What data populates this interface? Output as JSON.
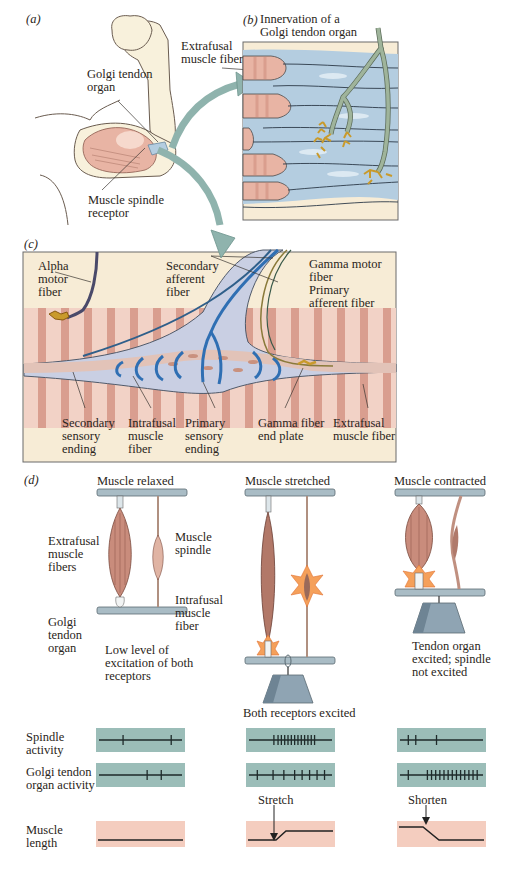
{
  "panels": {
    "a": {
      "letter": "(a)",
      "labels": {
        "golgi_tendon_organ": "Golgi tendon\norgan",
        "muscle_spindle_receptor": "Muscle spindle\nreceptor",
        "extrafusal_muscle_fiber": "Extrafusal\nmuscle fiber"
      }
    },
    "b": {
      "letter": "(b)",
      "title": "Innervation of a\nGolgi tendon organ"
    },
    "c": {
      "letter": "(c)",
      "labels": {
        "alpha_motor_fiber": "Alpha\nmotor\nfiber",
        "secondary_afferent_fiber": "Secondary\nafferent\nfiber",
        "gamma_motor_fiber": "Gamma motor\nfiber",
        "primary_afferent_fiber": "Primary\nafferent fiber",
        "secondary_sensory_ending": "Secondary\nsensory\nending",
        "intrafusal_muscle_fiber": "Intrafusal\nmuscle\nfiber",
        "primary_sensory_ending": "Primary\nsensory\nending",
        "gamma_fiber_end_plate": "Gamma fiber\nend plate",
        "extrafusal_muscle_fiber": "Extrafusal\nmuscle fiber"
      }
    },
    "d": {
      "letter": "(d)",
      "conditions": [
        {
          "title": "Muscle relaxed",
          "caption": "Low level of\nexcitation of both\nreceptors"
        },
        {
          "title": "Muscle stretched",
          "caption": "Both receptors excited"
        },
        {
          "title": "Muscle contracted",
          "caption": "Tendon organ\nexcited; spindle\nnot excited"
        }
      ],
      "labels": {
        "extrafusal_muscle_fibers": "Extrafusal\nmuscle\nfibers",
        "muscle_spindle": "Muscle\nspindle",
        "intrafusal_muscle_fiber": "Intrafusal\nmuscle\nfiber",
        "golgi_tendon_organ": "Golgi\ntendon\norgan"
      },
      "row_labels": {
        "spindle_activity": "Spindle\nactivity",
        "golgi_activity": "Golgi tendon\norgan activity",
        "muscle_length": "Muscle\nlength"
      },
      "length_annotations": {
        "stretch": "Stretch",
        "shorten": "Shorten"
      },
      "spike_trains": {
        "spindle": [
          [
            0.29,
            0.87
          ],
          [
            0.3,
            0.35,
            0.39,
            0.43,
            0.47,
            0.51,
            0.55,
            0.59,
            0.63,
            0.67,
            0.71,
            0.75,
            0.79
          ],
          [
            0.1,
            0.19,
            0.44
          ]
        ],
        "golgi": [
          [
            0.58,
            0.75
          ],
          [
            0.1,
            0.29,
            0.42,
            0.55,
            0.64,
            0.73,
            0.82,
            0.91
          ],
          [
            0.1,
            0.33,
            0.38,
            0.43,
            0.48,
            0.53,
            0.58,
            0.63,
            0.68,
            0.73,
            0.78,
            0.83,
            0.88,
            0.93
          ]
        ]
      }
    }
  },
  "colors": {
    "muscle_pink": "#e8b4a4",
    "muscle_stripe": "#d59686",
    "tendon_blue": "#b4cde0",
    "cream_bg": "#f7ecd6",
    "trace_teal": "#9bbdb8",
    "trace_salmon": "#f4cdbf",
    "nerve_blue": "#2f6fb3",
    "arrow_teal": "#8fb3ad",
    "nerve_green": "#9fb49b",
    "gold_ending": "#c99a2b",
    "bar_gray": "#a9bcc5",
    "weight_gray": "#8fa4b3"
  }
}
